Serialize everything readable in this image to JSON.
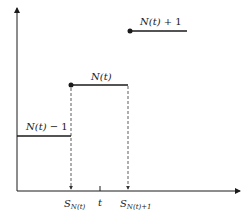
{
  "diagram": {
    "type": "step-function",
    "axes": {
      "x_axis": "horizontal arrow",
      "y_axis": "vertical arrow"
    },
    "levels": [
      {
        "label": "N(t) − 1",
        "label_func": "N(t)",
        "label_suffix": " − 1"
      },
      {
        "label": "N(t)",
        "label_func": "N(t)",
        "label_suffix": ""
      },
      {
        "label": "N(t) + 1",
        "label_func": "N(t)",
        "label_suffix": " + 1"
      }
    ],
    "x_labels": {
      "s_nt": {
        "base": "S",
        "sub": "N(t)"
      },
      "t": "t",
      "s_nt1": {
        "base": "S",
        "sub": "N(t)+1"
      }
    },
    "colors": {
      "line": "#1a1a1a",
      "dashed": "#333333"
    }
  }
}
